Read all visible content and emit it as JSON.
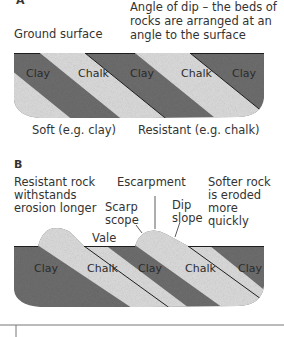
{
  "panel_a": {
    "label": "A",
    "ground_surface": "Ground surface",
    "angle_of_dip": [
      "Angle of dip – the beds of",
      "rocks are arranged at an",
      "angle to the surface"
    ],
    "rock_labels": [
      "Clay",
      "Chalk",
      "Clay",
      "Chalk",
      "Clay"
    ],
    "soft": "Soft (e.g. clay)",
    "resistant": "Resistant (e.g. chalk)"
  },
  "panel_b": {
    "label": "B",
    "resistant_rock": [
      "Resistant rock",
      "withstands",
      "erosion longer"
    ],
    "escarpment": "Escarpment",
    "softer_rock": [
      "Softer rock",
      "is eroded",
      "more",
      "quickly"
    ],
    "scarp_slope": [
      "Scarp",
      "scope"
    ],
    "dip_slope": [
      "Dip",
      "slope"
    ],
    "vale": "Vale",
    "rock_labels": [
      "Clay",
      "Chalk",
      "Clay",
      "Chalk",
      "Clay"
    ]
  },
  "colors": {
    "clay": "#6e6e6e",
    "chalk": "#dcdcdc",
    "line": "#1e1e1e"
  }
}
